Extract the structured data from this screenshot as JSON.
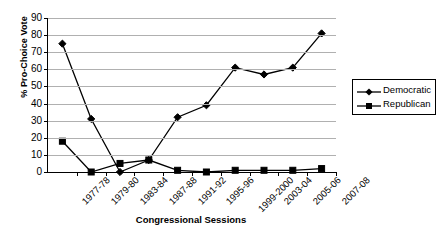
{
  "chart_data": {
    "type": "line",
    "title": "",
    "xlabel": "Congressional Sessions",
    "ylabel": "% Pro-Choice Vote",
    "categories": [
      "1977-78",
      "1979-80",
      "1983-84",
      "1987-88",
      "1991-92",
      "1995-96",
      "1999-2000",
      "2003-04",
      "2005-06",
      "2007-08"
    ],
    "series": [
      {
        "name": "Democratic",
        "marker": "diamond",
        "color": "#000000",
        "values": [
          75,
          31,
          0,
          7,
          32,
          39,
          61,
          57,
          61,
          81
        ]
      },
      {
        "name": "Republican",
        "marker": "square",
        "color": "#000000",
        "values": [
          18,
          0,
          5,
          7,
          1,
          0,
          1,
          1,
          1,
          2
        ]
      }
    ],
    "ylim": [
      0,
      90
    ],
    "yticks": [
      0,
      10,
      20,
      30,
      40,
      50,
      60,
      70,
      80,
      90
    ],
    "grid": true,
    "legend_position": "right"
  },
  "legend": {
    "entries": [
      {
        "label": "Democratic"
      },
      {
        "label": "Republican"
      }
    ]
  }
}
